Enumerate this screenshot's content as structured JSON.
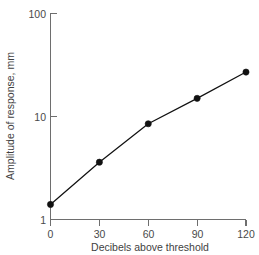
{
  "chart_data": {
    "type": "line",
    "title": "",
    "subtitle": "",
    "xlabel": "Decibels above threshold",
    "ylabel": "Amplitude of response, mm",
    "x": [
      0,
      30,
      60,
      90,
      120
    ],
    "values": [
      1.4,
      3.6,
      8.5,
      15,
      27
    ],
    "series": [
      {
        "name": "Amplitude of response",
        "x": [
          0,
          30,
          60,
          90,
          120
        ],
        "values": [
          1.4,
          3.6,
          8.5,
          15,
          27
        ]
      }
    ],
    "xticks": [
      "0",
      "30",
      "60",
      "90",
      "120"
    ],
    "xtick_values": [
      0,
      30,
      60,
      90,
      120
    ],
    "yticks": [
      "1",
      "10",
      "100"
    ],
    "ytick_values": [
      1,
      10,
      100
    ],
    "xlim": [
      0,
      120
    ],
    "ylim": [
      1,
      100
    ],
    "yscale": "log",
    "xscale": "linear",
    "grid": false,
    "legend": false,
    "legend_position": "none",
    "marker": "filled-circle",
    "line_color": "#111111",
    "marker_color": "#111111",
    "axis_color": "#6e6e6e",
    "background": "#ffffff"
  }
}
